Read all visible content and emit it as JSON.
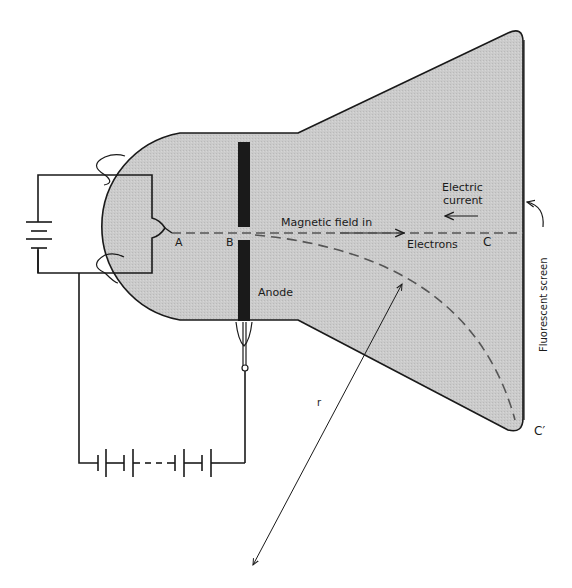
{
  "figure": {
    "colors": {
      "tube_fill": "#c9c9c9",
      "outline": "#1a1a1a",
      "anode": "#1a1a1a",
      "background": "#ffffff"
    }
  },
  "labels": {
    "point_a": "A",
    "point_b": "B",
    "point_c": "C",
    "point_c_prime": "C′",
    "magnetic_field": "Magnetic field  in",
    "electrons": "Electrons",
    "electric_current_line1": "Electric",
    "electric_current_line2": "current",
    "anode": "Anode",
    "fluorescent_screen": "Fluorescent screen",
    "radius": "r"
  },
  "components": {
    "heater_battery": "battery-symbol",
    "high_voltage_battery": "battery-series-symbol",
    "anode": "anode-plate",
    "cathode": "filament",
    "tube": "cathode-ray-tube"
  }
}
